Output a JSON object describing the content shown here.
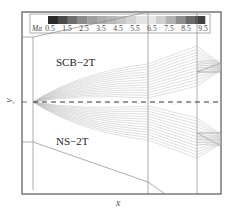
{
  "figure": {
    "type": "flow-field-diagram"
  },
  "regions": {
    "upper": "SCB−2T",
    "lower": "NS−2T"
  },
  "axes": {
    "x_label": "x",
    "y_label": "y"
  },
  "colorbar": {
    "variable": "Ma",
    "ticks": [
      "0.5",
      "1.5",
      "2.5",
      "3.5",
      "4.5",
      "5.5",
      "6.5",
      "7.5",
      "8.5",
      "9.5"
    ],
    "colors": [
      "#2a2a2a",
      "#4a4a4a",
      "#6e6e6e",
      "#8a8a8a",
      "#9e9e9e",
      "#acacac",
      "#b8b8b8",
      "#c6c6c6",
      "#d4d4d4",
      "#e4e4e4",
      "#e8e8e8",
      "#cfcfcf",
      "#b2b2b2",
      "#8e8e8e",
      "#6a6a6a",
      "#404040"
    ]
  },
  "colors": {
    "frame": "#555555",
    "wall": "#888888",
    "streamline": "#b5b5b5",
    "centerline": "#333333"
  }
}
